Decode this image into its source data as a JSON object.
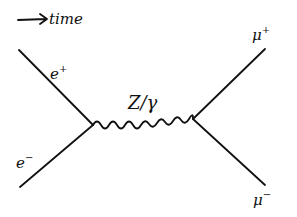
{
  "diagram": {
    "type": "feynman",
    "time_arrow": {
      "label": "time",
      "direction": "right"
    },
    "vertices": [
      {
        "id": "v1",
        "x": 93,
        "y": 125
      },
      {
        "id": "v2",
        "x": 193,
        "y": 119
      }
    ],
    "particles": {
      "e_plus": {
        "label": "e",
        "sup": "+"
      },
      "e_minus": {
        "label": "e",
        "sup": "−"
      },
      "mu_plus": {
        "label": "μ",
        "sup": "+"
      },
      "mu_minus": {
        "label": "μ",
        "sup": "−"
      },
      "boson": {
        "label": "Z/γ",
        "style": "wavy"
      }
    },
    "colors": {
      "ink": "#111111",
      "background": "#ffffff"
    }
  }
}
